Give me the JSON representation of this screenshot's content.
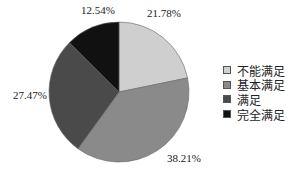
{
  "chart_data": {
    "type": "pie",
    "title": "",
    "categories": [
      "不能满足",
      "基本满足",
      "满足",
      "完全满足"
    ],
    "values": [
      21.78,
      38.21,
      27.47,
      12.54
    ],
    "labels": [
      "21.78%",
      "38.21%",
      "27.47%",
      "12.54%"
    ],
    "colors": [
      "#cfcfcf",
      "#8a8a8a",
      "#4a4a4a",
      "#111111"
    ],
    "start_angle": "12 o'clock",
    "direction": "clockwise",
    "legend_position": "right"
  },
  "labels": {
    "slice0": "21.78%",
    "slice1": "38.21%",
    "slice2": "27.47%",
    "slice3": "12.54%"
  },
  "legend": [
    {
      "label": "不能满足",
      "color": "#cfcfcf"
    },
    {
      "label": "基本满足",
      "color": "#8a8a8a"
    },
    {
      "label": "满足",
      "color": "#4a4a4a"
    },
    {
      "label": "完全满足",
      "color": "#111111"
    }
  ]
}
